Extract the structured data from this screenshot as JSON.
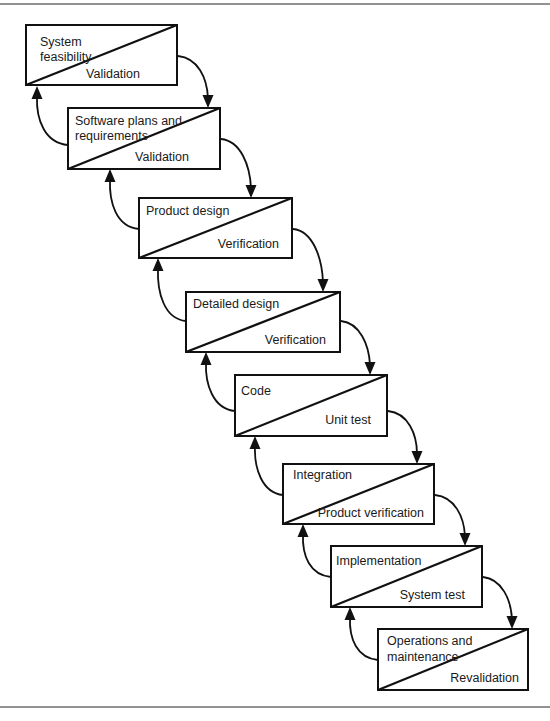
{
  "diagram": {
    "frame": {
      "top_rule_y": 4,
      "bottom_rule_y": 707,
      "color": "#6e6e6e"
    },
    "stages": [
      {
        "id": "system-feasibility",
        "top_lines": [
          "System",
          "feasibility"
        ],
        "bottom_label": "Validation",
        "box": {
          "x": 26,
          "y": 25,
          "w": 151,
          "h": 60
        },
        "top_text_x": 40,
        "top_baselines": [
          46,
          61
        ],
        "bottom_text_end_x": 140,
        "bottom_baseline": 78
      },
      {
        "id": "software-plans-requirements",
        "top_lines": [
          "Software plans and",
          "requirements"
        ],
        "bottom_label": "Validation",
        "box": {
          "x": 68,
          "y": 108,
          "w": 152,
          "h": 61
        },
        "top_text_x": 75,
        "top_baselines": [
          125,
          140
        ],
        "bottom_text_end_x": 189,
        "bottom_baseline": 161
      },
      {
        "id": "product-design",
        "top_lines": [
          "Product design"
        ],
        "bottom_label": "Verification",
        "box": {
          "x": 139,
          "y": 198,
          "w": 153,
          "h": 60
        },
        "top_text_x": 146,
        "top_baselines": [
          215
        ],
        "bottom_text_end_x": 279,
        "bottom_baseline": 248
      },
      {
        "id": "detailed-design",
        "top_lines": [
          "Detailed design"
        ],
        "bottom_label": "Verification",
        "box": {
          "x": 186,
          "y": 292,
          "w": 154,
          "h": 60
        },
        "top_text_x": 193,
        "top_baselines": [
          308
        ],
        "bottom_text_end_x": 326,
        "bottom_baseline": 344
      },
      {
        "id": "code",
        "top_lines": [
          "Code"
        ],
        "bottom_label": "Unit test",
        "box": {
          "x": 235,
          "y": 375,
          "w": 152,
          "h": 61
        },
        "top_text_x": 241,
        "top_baselines": [
          395
        ],
        "bottom_text_end_x": 371,
        "bottom_baseline": 424
      },
      {
        "id": "integration",
        "top_lines": [
          "Integration"
        ],
        "bottom_label": "Product verification",
        "box": {
          "x": 283,
          "y": 464,
          "w": 151,
          "h": 60
        },
        "top_text_x": 293,
        "top_baselines": [
          479
        ],
        "bottom_text_end_x": 424,
        "bottom_baseline": 517
      },
      {
        "id": "implementation",
        "top_lines": [
          "Implementation"
        ],
        "bottom_label": "System test",
        "box": {
          "x": 331,
          "y": 546,
          "w": 151,
          "h": 61
        },
        "top_text_x": 336,
        "top_baselines": [
          565
        ],
        "bottom_text_end_x": 465,
        "bottom_baseline": 599
      },
      {
        "id": "operations-maintenance",
        "top_lines": [
          "Operations and",
          "maintenance"
        ],
        "bottom_label": "Revalidation",
        "box": {
          "x": 378,
          "y": 629,
          "w": 150,
          "h": 61
        },
        "top_text_x": 387,
        "top_baselines": [
          645,
          661
        ],
        "bottom_text_end_x": 519,
        "bottom_baseline": 682
      }
    ],
    "forward_arrows": [
      {
        "from": "system-feasibility",
        "to": "software-plans-requirements",
        "d": "M178 56 C198 58 207 78 208 98",
        "tip": [
          208,
          108
        ]
      },
      {
        "from": "software-plans-requirements",
        "to": "product-design",
        "d": "M221 139 C241 141 250 166 251 188",
        "tip": [
          251,
          198
        ]
      },
      {
        "from": "product-design",
        "to": "detailed-design",
        "d": "M293 229 C313 231 322 258 323 282",
        "tip": [
          323,
          292
        ]
      },
      {
        "from": "detailed-design",
        "to": "code",
        "d": "M341 321 C360 323 369 345 370 365",
        "tip": [
          370,
          375
        ]
      },
      {
        "from": "code",
        "to": "integration",
        "d": "M388 411 C408 413 417 434 417 454",
        "tip": [
          417,
          464
        ]
      },
      {
        "from": "integration",
        "to": "implementation",
        "d": "M435 495 C455 497 464 517 465 536",
        "tip": [
          465,
          546
        ]
      },
      {
        "from": "implementation",
        "to": "operations-maintenance",
        "d": "M483 577 C502 579 511 600 512 619",
        "tip": [
          512,
          629
        ]
      }
    ],
    "back_arrows": [
      {
        "from": "software-plans-requirements",
        "to": "system-feasibility",
        "d": "M68 145 C45 143 36 120 37 96",
        "tip": [
          37,
          86
        ]
      },
      {
        "from": "product-design",
        "to": "software-plans-requirements",
        "d": "M139 229 C116 227 109 202 110 179",
        "tip": [
          110,
          169
        ]
      },
      {
        "from": "detailed-design",
        "to": "product-design",
        "d": "M186 321 C164 319 157 292 158 268",
        "tip": [
          158,
          258
        ]
      },
      {
        "from": "code",
        "to": "detailed-design",
        "d": "M235 411 C213 409 205 384 206 362",
        "tip": [
          206,
          352
        ]
      },
      {
        "from": "integration",
        "to": "code",
        "d": "M283 495 C262 493 254 468 255 446",
        "tip": [
          255,
          436
        ]
      },
      {
        "from": "implementation",
        "to": "integration",
        "d": "M331 577 C310 575 302 556 303 534",
        "tip": [
          303,
          524
        ]
      },
      {
        "from": "operations-maintenance",
        "to": "implementation",
        "d": "M378 660 C357 658 349 639 350 617",
        "tip": [
          350,
          607
        ]
      }
    ]
  }
}
